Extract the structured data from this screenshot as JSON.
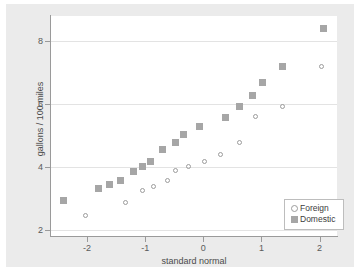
{
  "chart_data": {
    "type": "scatter",
    "title": "",
    "xlabel": "standard normal",
    "ylabel": "gallons / 100 miles",
    "xlim": [
      -2.62,
      2.3
    ],
    "ylim": [
      1.8,
      8.8
    ],
    "xticks": [
      -2,
      -1,
      0,
      1,
      2
    ],
    "xticklabels": [
      "-2",
      "-1",
      "0",
      "1",
      "2"
    ],
    "yticks": [
      2,
      4,
      6,
      8
    ],
    "yticklabels": [
      "2",
      "4",
      "6",
      "8"
    ],
    "grid": "horizontal",
    "legend_position": "bottom-right",
    "series": [
      {
        "name": "Foreign",
        "marker": "open-circle",
        "color": "#9c9c9c",
        "points": [
          [
            -2.02,
            2.45
          ],
          [
            -1.34,
            2.88
          ],
          [
            -1.04,
            3.25
          ],
          [
            -0.86,
            3.38
          ],
          [
            -0.62,
            3.58
          ],
          [
            -0.48,
            3.88
          ],
          [
            -0.26,
            4.02
          ],
          [
            0.02,
            4.18
          ],
          [
            0.3,
            4.38
          ],
          [
            0.62,
            4.78
          ],
          [
            0.9,
            5.6
          ],
          [
            1.36,
            5.92
          ],
          [
            2.04,
            7.18
          ]
        ]
      },
      {
        "name": "Domestic",
        "marker": "filled-square",
        "color": "#a6a6a6",
        "points": [
          [
            -2.4,
            2.92
          ],
          [
            -1.8,
            3.32
          ],
          [
            -1.62,
            3.44
          ],
          [
            -1.42,
            3.58
          ],
          [
            -1.2,
            3.86
          ],
          [
            -1.04,
            4.02
          ],
          [
            -0.9,
            4.18
          ],
          [
            -0.7,
            4.55
          ],
          [
            -0.48,
            4.78
          ],
          [
            -0.34,
            5.02
          ],
          [
            -0.06,
            5.3
          ],
          [
            0.38,
            5.58
          ],
          [
            0.62,
            5.92
          ],
          [
            0.84,
            6.28
          ],
          [
            1.02,
            6.68
          ],
          [
            1.36,
            7.18
          ],
          [
            2.06,
            8.4
          ]
        ]
      }
    ]
  },
  "legend": {
    "entries": [
      {
        "label": "Foreign",
        "marker": "open-circle"
      },
      {
        "label": "Domestic",
        "marker": "filled-square"
      }
    ]
  },
  "colors": {
    "graph_background": "#ebebeb",
    "plot_background": "#ffffff",
    "axis": "#9a9a9a",
    "gridline": "#e3e3e3",
    "text": "#4a4a4a"
  }
}
